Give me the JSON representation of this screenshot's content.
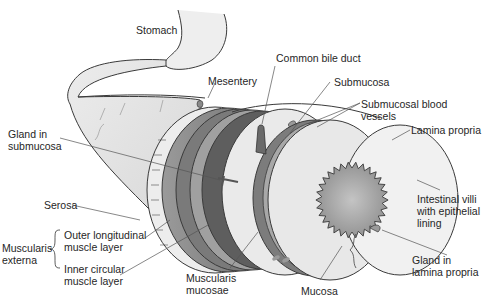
{
  "diagram": {
    "title_partial": "...",
    "labels": {
      "stomach": "Stomach",
      "mesentery": "Mesentery",
      "common_bile_duct": "Common bile duct",
      "submucosa": "Submucosa",
      "submucosal_blood_vessels": "Submucosal blood\nvessels",
      "lamina_propria": "Lamina propria",
      "gland_in_submucosa": "Gland in\nsubmucosa",
      "serosa": "Serosa",
      "intestinal_villi": "Intestinal villi\nwith epithelial\nlining",
      "muscularis_externa": "Muscularis\nexterna",
      "outer_longitudinal": "Outer longitudinal\nmuscle layer",
      "inner_circular": "Inner circular\nmuscle layer",
      "muscularis_mucosae": "Muscularis\nmucosae",
      "mucosa": "Mucosa",
      "gland_in_lamina_propria": "Gland in\nlamina propria"
    },
    "colors": {
      "tissue_light": "#e4e4e4",
      "tissue_mid": "#bdbdbd",
      "muscle_dark": "#6e6e6e",
      "muscle_mid": "#8c8c8c",
      "lumen": "#a8a8a8",
      "outline": "#3a3a3a",
      "leader": "#555555",
      "text": "#262626"
    }
  }
}
